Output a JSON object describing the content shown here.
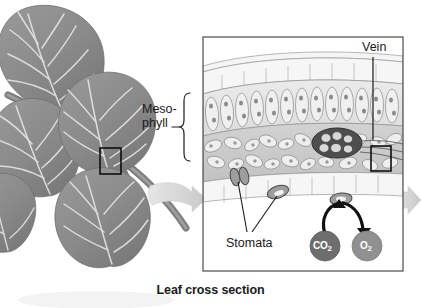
{
  "figure": {
    "caption": "Leaf cross section",
    "background_color": "#ffffff",
    "text_color": "#1a1a1a",
    "width": 421,
    "height": 308
  },
  "labels": {
    "mesophyll_line1": "Meso-",
    "mesophyll_line2": "phyll",
    "vein": "Vein",
    "stomata": "Stomata"
  },
  "molecules": [
    {
      "name": "carbon-dioxide",
      "formula_main": "CO",
      "formula_sub": "2",
      "fill_color": "#6e6e6e",
      "text_color": "#ffffff",
      "direction": "into-leaf"
    },
    {
      "name": "oxygen",
      "formula_main": "O",
      "formula_sub": "2",
      "fill_color": "#909090",
      "text_color": "#ffffff",
      "direction": "out-of-leaf"
    }
  ],
  "leaf_illustration": {
    "name": "leaf-branch-drawing",
    "leaf_count": 5,
    "leaf_fill": "#8d8d8d",
    "vein_color": "#e8e8e8",
    "stem_color": "#6f6f6f",
    "selection_box_color": "#101010"
  },
  "cross_section": {
    "name": "leaf-cross-section-panel",
    "border_color": "#5a5a5a",
    "layers": [
      {
        "name": "cuticle",
        "fill": "#f2f2f2"
      },
      {
        "name": "upper-epidermis",
        "fill": "#f4f4f4"
      },
      {
        "name": "palisade-mesophyll",
        "fill": "#e4e4e4"
      },
      {
        "name": "spongy-mesophyll",
        "fill": "#c9c9c9"
      },
      {
        "name": "lower-epidermis",
        "fill": "#f4f4f4"
      }
    ],
    "vascular_bundle": {
      "name": "vein-bundle",
      "fill": "#4a4a4a"
    },
    "stomata_count": 2,
    "inset_box_color": "#101010"
  },
  "arrows": {
    "zoom_arrow_color": "#d6d6d6",
    "exit_arrow_color": "#d6d6d6",
    "gas_arrow_color": "#111111",
    "leader_line_color": "#1a1a1a"
  }
}
